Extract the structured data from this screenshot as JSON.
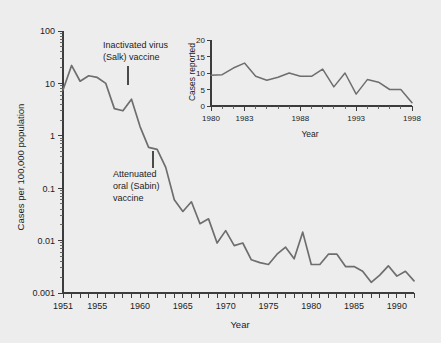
{
  "figure": {
    "background_color": "#ededed",
    "line_color": "#6e6e6e",
    "axis_color": "#3c3c3c"
  },
  "annotations": [
    {
      "id": "salk",
      "line1": "Inactivated virus",
      "line2": "(Salk) vaccine",
      "year": 1955
    },
    {
      "id": "sabin",
      "line1": "Attenuated",
      "line2": "oral (Sabin)",
      "line3": "vaccine",
      "year": 1961
    }
  ],
  "chart_data": {
    "type": "line",
    "title": "",
    "xlabel": "Year",
    "ylabel": "Cases per 100,000 population",
    "yscale": "log",
    "ylim": [
      0.001,
      100
    ],
    "xlim": [
      1951,
      1992
    ],
    "grid": false,
    "legend": "none",
    "ytick_labels": [
      "100",
      "10",
      "1",
      "0.1",
      "0.01",
      "0.001"
    ],
    "ytick_values": [
      100,
      10,
      1,
      0.1,
      0.01,
      0.001
    ],
    "xtick_labels": [
      "1951",
      "1955",
      "1960",
      "1965",
      "1970",
      "1975",
      "1980",
      "1985",
      "1990"
    ],
    "xtick_values": [
      1951,
      1955,
      1960,
      1965,
      1970,
      1975,
      1980,
      1985,
      1990
    ],
    "x": [
      1951,
      1952,
      1953,
      1954,
      1955,
      1956,
      1957,
      1958,
      1959,
      1960,
      1961,
      1962,
      1963,
      1964,
      1965,
      1966,
      1967,
      1968,
      1969,
      1970,
      1971,
      1972,
      1973,
      1974,
      1975,
      1976,
      1977,
      1978,
      1979,
      1980,
      1981,
      1982,
      1983,
      1984,
      1985,
      1986,
      1987,
      1988,
      1989,
      1990,
      1991,
      1992
    ],
    "values": [
      7.5,
      22,
      11,
      14,
      13,
      10,
      3.3,
      3.0,
      5.0,
      1.5,
      0.6,
      0.55,
      0.25,
      0.06,
      0.036,
      0.055,
      0.021,
      0.026,
      0.009,
      0.0155,
      0.008,
      0.009,
      0.0043,
      0.0038,
      0.0035,
      0.0055,
      0.0075,
      0.0045,
      0.0145,
      0.0035,
      0.0035,
      0.0055,
      0.0055,
      0.0032,
      0.0032,
      0.0026,
      0.0016,
      0.0022,
      0.0033,
      0.0021,
      0.0026,
      0.0017
    ],
    "inset": {
      "type": "line",
      "title": "",
      "xlabel": "Year",
      "ylabel": "Cases reported",
      "yscale": "linear",
      "ylim": [
        0,
        20
      ],
      "xlim": [
        1980,
        1998
      ],
      "grid": false,
      "ytick_labels": [
        "0",
        "5",
        "10",
        "15",
        "20"
      ],
      "ytick_values": [
        0,
        5,
        10,
        15,
        20
      ],
      "xtick_labels": [
        "1980",
        "1983",
        "1988",
        "1993",
        "1998"
      ],
      "xtick_values": [
        1980,
        1983,
        1988,
        1993,
        1998
      ],
      "x": [
        1980,
        1981,
        1982,
        1983,
        1984,
        1985,
        1986,
        1987,
        1988,
        1989,
        1990,
        1991,
        1992,
        1993,
        1994,
        1995,
        1996,
        1997,
        1998
      ],
      "values": [
        9.3,
        9.5,
        11.5,
        13.0,
        9.0,
        7.8,
        8.7,
        10.0,
        9.0,
        9.0,
        11.2,
        5.8,
        10.0,
        3.6,
        8.0,
        7.2,
        5.0,
        5.0,
        1.0
      ]
    }
  }
}
